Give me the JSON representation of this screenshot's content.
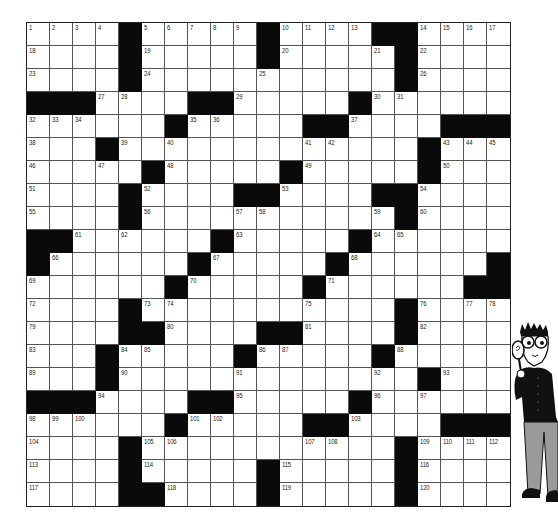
{
  "puzzle": {
    "rows": 21,
    "cols": 21,
    "legend": {
      "black": "#",
      "empty": "."
    },
    "grid": [
      [
        "1",
        "2",
        "3",
        "4",
        "#",
        "5",
        "6",
        "7",
        "8",
        "9",
        "#",
        "10",
        "11",
        "12",
        "13",
        "#",
        "#",
        "14",
        "15",
        "16",
        "17"
      ],
      [
        "18",
        ".",
        ".",
        ".",
        "#",
        "19",
        ".",
        ".",
        ".",
        ".",
        "#",
        "20",
        ".",
        ".",
        ".",
        "21",
        "#",
        "22",
        ".",
        ".",
        "."
      ],
      [
        "23",
        ".",
        ".",
        ".",
        "#",
        "24",
        ".",
        ".",
        ".",
        ".",
        "25",
        ".",
        ".",
        ".",
        ".",
        ".",
        "#",
        "26",
        ".",
        ".",
        "."
      ],
      [
        "#",
        "#",
        "#",
        "27",
        "28",
        ".",
        ".",
        "#",
        "#",
        "29",
        ".",
        ".",
        ".",
        ".",
        "#",
        "30",
        "31",
        ".",
        ".",
        ".",
        "."
      ],
      [
        "32",
        "33",
        "34",
        ".",
        ".",
        ".",
        "#",
        "35",
        "36",
        ".",
        ".",
        ".",
        "#",
        "#",
        "37",
        ".",
        ".",
        ".",
        "#",
        "#",
        "#"
      ],
      [
        "38",
        ".",
        ".",
        "#",
        "39",
        ".",
        "40",
        ".",
        ".",
        ".",
        ".",
        ".",
        "41",
        "42",
        ".",
        ".",
        ".",
        "#",
        "43",
        "44",
        "45"
      ],
      [
        "46",
        ".",
        ".",
        "47",
        ".",
        "#",
        "48",
        ".",
        ".",
        ".",
        ".",
        "#",
        "49",
        ".",
        ".",
        ".",
        ".",
        "#",
        "50",
        ".",
        "."
      ],
      [
        "51",
        ".",
        ".",
        ".",
        "#",
        "52",
        ".",
        ".",
        ".",
        "#",
        "#",
        "53",
        ".",
        ".",
        ".",
        "#",
        "#",
        "54",
        ".",
        ".",
        "."
      ],
      [
        "55",
        ".",
        ".",
        ".",
        "#",
        "56",
        ".",
        ".",
        ".",
        "57",
        "58",
        ".",
        ".",
        ".",
        ".",
        "59",
        "#",
        "60",
        ".",
        ".",
        "."
      ],
      [
        "#",
        "#",
        "61",
        ".",
        "62",
        ".",
        ".",
        ".",
        "#",
        "63",
        ".",
        ".",
        ".",
        ".",
        "#",
        "64",
        "65",
        ".",
        ".",
        ".",
        "."
      ],
      [
        "#",
        "66",
        ".",
        ".",
        ".",
        ".",
        ".",
        "#",
        "67",
        ".",
        ".",
        ".",
        ".",
        "#",
        "68",
        ".",
        ".",
        ".",
        ".",
        ".",
        "#"
      ],
      [
        "69",
        ".",
        ".",
        ".",
        ".",
        ".",
        "#",
        "70",
        ".",
        ".",
        ".",
        ".",
        "#",
        "71",
        ".",
        ".",
        ".",
        ".",
        ".",
        "#",
        "#"
      ],
      [
        "72",
        ".",
        ".",
        ".",
        "#",
        "73",
        "74",
        ".",
        ".",
        ".",
        ".",
        ".",
        "75",
        ".",
        ".",
        ".",
        "#",
        "76",
        ".",
        "77",
        "78"
      ],
      [
        "79",
        ".",
        ".",
        ".",
        "#",
        "#",
        "80",
        ".",
        ".",
        ".",
        "#",
        "#",
        "81",
        ".",
        ".",
        ".",
        "#",
        "82",
        ".",
        ".",
        "."
      ],
      [
        "83",
        ".",
        ".",
        "#",
        "84",
        "85",
        ".",
        ".",
        ".",
        "#",
        "86",
        "87",
        ".",
        ".",
        ".",
        "#",
        "88",
        ".",
        ".",
        ".",
        "."
      ],
      [
        "89",
        ".",
        ".",
        "#",
        "90",
        ".",
        ".",
        ".",
        ".",
        "91",
        ".",
        ".",
        ".",
        ".",
        ".",
        "92",
        ".",
        "#",
        "93",
        ".",
        "."
      ],
      [
        "#",
        "#",
        "#",
        "94",
        ".",
        ".",
        ".",
        "#",
        "#",
        "95",
        ".",
        ".",
        ".",
        ".",
        "#",
        "96",
        ".",
        "97",
        ".",
        ".",
        "."
      ],
      [
        "98",
        "99",
        "100",
        ".",
        ".",
        ".",
        "#",
        "101",
        "102",
        ".",
        ".",
        ".",
        "#",
        "#",
        "103",
        ".",
        ".",
        ".",
        "#",
        "#",
        "#"
      ],
      [
        "104",
        ".",
        ".",
        ".",
        "#",
        "105",
        "106",
        ".",
        ".",
        ".",
        ".",
        ".",
        "107",
        "108",
        ".",
        ".",
        "#",
        "109",
        "110",
        "111",
        "112"
      ],
      [
        "113",
        ".",
        ".",
        ".",
        "#",
        "114",
        ".",
        ".",
        ".",
        ".",
        "#",
        "115",
        ".",
        ".",
        ".",
        ".",
        "#",
        "116",
        ".",
        ".",
        "."
      ],
      [
        "117",
        ".",
        ".",
        ".",
        "#",
        "#",
        "118",
        ".",
        ".",
        ".",
        "#",
        "119",
        ".",
        ".",
        ".",
        ".",
        "#",
        "120",
        ".",
        ".",
        "."
      ]
    ]
  },
  "illustration": {
    "icon": "detective-with-magnifying-glass-icon",
    "colors": {
      "shirt": "#111111",
      "pants": "#9a9a9a",
      "skin": "#ffffff",
      "outline": "#111111"
    }
  },
  "colors": {
    "black_cell": "#0a0a0a",
    "white_cell": "#ffffff",
    "grid_line": "#555555",
    "number": "#222222"
  }
}
